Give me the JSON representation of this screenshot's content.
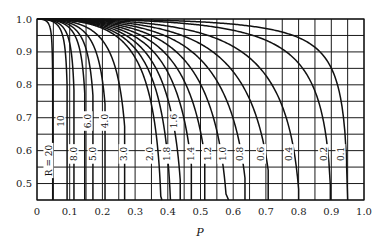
{
  "chart_data": {
    "type": "line",
    "title": "",
    "xlabel": "P",
    "ylabel": "",
    "xlim": [
      0,
      1.0
    ],
    "ylim": [
      0.45,
      1.0
    ],
    "grid": true,
    "grid_step": {
      "x": 0.05,
      "y": 0.05
    },
    "x_ticks": [
      "0",
      "0.1",
      "0.2",
      "0.3",
      "0.4",
      "0.5",
      "0.6",
      "0.7",
      "0.8",
      "0.9",
      "1.0"
    ],
    "x_tick_values": [
      0,
      0.1,
      0.2,
      0.3,
      0.4,
      0.5,
      0.6,
      0.7,
      0.8,
      0.9,
      1.0
    ],
    "y_ticks": [
      "0.5",
      "0.6",
      "0.7",
      "0.8",
      "0.9",
      "1.0"
    ],
    "y_tick_values": [
      0.5,
      0.6,
      0.7,
      0.8,
      0.9,
      1.0
    ],
    "legend": "none (curves labeled inline by R)",
    "series": [
      {
        "name": "R = 20",
        "label": "R = 20",
        "R": 20,
        "p_end": 0.048,
        "label_pos": [
          0.035,
          0.57
        ],
        "points": [
          [
            0,
            1.0
          ],
          [
            0.02,
            0.99
          ],
          [
            0.04,
            0.93
          ],
          [
            0.048,
            0.45
          ]
        ]
      },
      {
        "name": "R = 10",
        "label": "10",
        "R": 10,
        "p_end": 0.092,
        "label_pos": [
          0.072,
          0.69
        ],
        "points": [
          [
            0,
            1.0
          ],
          [
            0.04,
            0.99
          ],
          [
            0.08,
            0.92
          ],
          [
            0.092,
            0.45
          ]
        ]
      },
      {
        "name": "R = 8.0",
        "label": "8.0",
        "R": 8,
        "p_end": 0.113,
        "label_pos": [
          0.112,
          0.59
        ],
        "points": [
          [
            0,
            1.0
          ],
          [
            0.05,
            0.99
          ],
          [
            0.1,
            0.92
          ],
          [
            0.113,
            0.45
          ]
        ]
      },
      {
        "name": "R = 6.0",
        "label": "6.0",
        "R": 6,
        "p_end": 0.146,
        "label_pos": [
          0.155,
          0.69
        ],
        "points": [
          [
            0,
            1.0
          ],
          [
            0.06,
            0.99
          ],
          [
            0.13,
            0.91
          ],
          [
            0.146,
            0.45
          ]
        ]
      },
      {
        "name": "R = 5.0",
        "label": "5.0",
        "R": 5,
        "p_end": 0.171,
        "label_pos": [
          0.17,
          0.59
        ],
        "points": [
          [
            0,
            1.0
          ],
          [
            0.08,
            0.99
          ],
          [
            0.15,
            0.92
          ],
          [
            0.171,
            0.45
          ]
        ]
      },
      {
        "name": "R = 4.0",
        "label": "4.0",
        "R": 4,
        "p_end": 0.208,
        "label_pos": [
          0.205,
          0.69
        ],
        "points": [
          [
            0,
            1.0
          ],
          [
            0.1,
            0.98
          ],
          [
            0.18,
            0.92
          ],
          [
            0.208,
            0.45
          ]
        ]
      },
      {
        "name": "R = 3.0",
        "label": "3.0",
        "R": 3,
        "p_end": 0.268,
        "label_pos": [
          0.265,
          0.59
        ],
        "points": [
          [
            0,
            1.0
          ],
          [
            0.12,
            0.98
          ],
          [
            0.23,
            0.91
          ],
          [
            0.268,
            0.45
          ]
        ]
      },
      {
        "name": "R = 2.0",
        "label": "2.0",
        "R": 2,
        "p_end": 0.382,
        "label_pos": [
          0.345,
          0.59
        ],
        "points": [
          [
            0,
            1.0
          ],
          [
            0.18,
            0.98
          ],
          [
            0.32,
            0.9
          ],
          [
            0.382,
            0.45
          ]
        ]
      },
      {
        "name": "R = 1.8",
        "label": "1.8",
        "R": 1.8,
        "p_end": 0.408,
        "label_pos": [
          0.395,
          0.59
        ],
        "points": [
          [
            0,
            1.0
          ],
          [
            0.2,
            0.98
          ],
          [
            0.34,
            0.9
          ],
          [
            0.408,
            0.45
          ]
        ]
      },
      {
        "name": "R = 1.6",
        "label": "1.6",
        "R": 1.6,
        "p_end": 0.438,
        "label_pos": [
          0.418,
          0.69
        ],
        "points": [
          [
            0,
            1.0
          ],
          [
            0.22,
            0.98
          ],
          [
            0.37,
            0.89
          ],
          [
            0.438,
            0.45
          ]
        ]
      },
      {
        "name": "R = 1.4",
        "label": "1.4",
        "R": 1.4,
        "p_end": 0.472,
        "label_pos": [
          0.47,
          0.59
        ],
        "points": [
          [
            0,
            1.0
          ],
          [
            0.24,
            0.98
          ],
          [
            0.4,
            0.89
          ],
          [
            0.472,
            0.45
          ]
        ]
      },
      {
        "name": "R = 1.2",
        "label": "1.2",
        "R": 1.2,
        "p_end": 0.513,
        "label_pos": [
          0.52,
          0.59
        ],
        "points": [
          [
            0,
            1.0
          ],
          [
            0.26,
            0.98
          ],
          [
            0.44,
            0.89
          ],
          [
            0.513,
            0.45
          ]
        ]
      },
      {
        "name": "R = 1.0",
        "label": "1.0",
        "R": 1.0,
        "p_end": 0.586,
        "label_pos": [
          0.567,
          0.59
        ],
        "points": [
          [
            0,
            1.0
          ],
          [
            0.3,
            0.97
          ],
          [
            0.48,
            0.88
          ],
          [
            0.586,
            0.45
          ]
        ]
      },
      {
        "name": "R = 0.8",
        "label": "0.8",
        "R": 0.8,
        "p_end": 0.636,
        "label_pos": [
          0.62,
          0.59
        ],
        "points": [
          [
            0,
            1.0
          ],
          [
            0.33,
            0.97
          ],
          [
            0.53,
            0.88
          ],
          [
            0.636,
            0.45
          ]
        ]
      },
      {
        "name": "R = 0.6",
        "label": "0.6",
        "R": 0.6,
        "p_end": 0.707,
        "label_pos": [
          0.685,
          0.59
        ],
        "points": [
          [
            0,
            1.0
          ],
          [
            0.38,
            0.97
          ],
          [
            0.6,
            0.88
          ],
          [
            0.707,
            0.45
          ]
        ]
      },
      {
        "name": "R = 0.4",
        "label": "0.4",
        "R": 0.4,
        "p_end": 0.8,
        "label_pos": [
          0.77,
          0.59
        ],
        "points": [
          [
            0,
            1.0
          ],
          [
            0.45,
            0.97
          ],
          [
            0.68,
            0.88
          ],
          [
            0.8,
            0.45
          ]
        ]
      },
      {
        "name": "R = 0.2",
        "label": "0.2",
        "R": 0.2,
        "p_end": 0.897,
        "label_pos": [
          0.875,
          0.59
        ],
        "points": [
          [
            0,
            1.0
          ],
          [
            0.55,
            0.97
          ],
          [
            0.78,
            0.88
          ],
          [
            0.897,
            0.45
          ]
        ]
      },
      {
        "name": "R = 0.1",
        "label": "0.1",
        "R": 0.1,
        "p_end": 0.95,
        "label_pos": [
          0.928,
          0.59
        ],
        "points": [
          [
            0,
            1.0
          ],
          [
            0.62,
            0.97
          ],
          [
            0.84,
            0.88
          ],
          [
            0.95,
            0.45
          ]
        ]
      }
    ]
  },
  "colors": {
    "ink": "#111111",
    "grid": "#1a1a1a",
    "background": "#ffffff"
  }
}
